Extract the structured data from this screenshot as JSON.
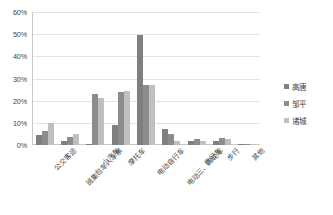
{
  "chart_data": {
    "type": "bar",
    "title": "",
    "xlabel": "",
    "ylabel": "",
    "ylim": [
      0,
      60
    ],
    "y_tick_step": 10,
    "y_tick_labels": [
      "0%",
      "10%",
      "20%",
      "30%",
      "40%",
      "50%",
      "60%"
    ],
    "y_tick_values": [
      0,
      10,
      20,
      30,
      40,
      50,
      60
    ],
    "grid": true,
    "legend_position": "right",
    "value_unit": "%",
    "categories": [
      "公交客运",
      "班集包车人车票",
      "小汽车",
      "摩托车",
      "电动自行车",
      "电动三、四轮车",
      "自行车",
      "步行",
      "其他"
    ],
    "series": [
      {
        "name": "高唐",
        "color": "#7f7f7f",
        "values": [
          4.5,
          1.8,
          0.3,
          9.0,
          49.5,
          7.0,
          2.0,
          2.0,
          0.5
        ]
      },
      {
        "name": "邹平",
        "color": "#8c8c8c",
        "values": [
          6.5,
          3.5,
          23.0,
          24.0,
          27.0,
          5.0,
          2.5,
          3.0,
          0.5
        ]
      },
      {
        "name": "诸城",
        "color": "#bfbfbf",
        "values": [
          10.0,
          5.0,
          21.0,
          24.5,
          27.0,
          2.0,
          2.0,
          2.5,
          0.4
        ]
      }
    ]
  },
  "legend": {
    "items": [
      {
        "label": "高唐",
        "color": "#7f7f7f"
      },
      {
        "label": "邹平",
        "color": "#8c8c8c"
      },
      {
        "label": "诸城",
        "color": "#bfbfbf"
      }
    ]
  }
}
